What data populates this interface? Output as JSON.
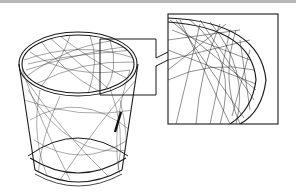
{
  "illustration": {
    "subject": "scratched drinking glass with magnified detail callout",
    "stroke_color": "#1a1a1a",
    "scratch_color": "#333333",
    "background": "#ffffff",
    "top_bar_color": "#b8b8b8"
  }
}
